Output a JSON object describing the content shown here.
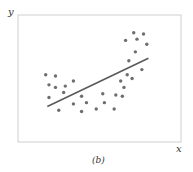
{
  "chart_data": {
    "type": "scatter",
    "title": "",
    "caption": "(b)",
    "xlabel": "x",
    "ylabel": "y",
    "grid": false,
    "legend": null,
    "xlim": [
      0,
      100
    ],
    "ylim": [
      0,
      100
    ],
    "points": [
      {
        "x": 17,
        "y": 53
      },
      {
        "x": 23,
        "y": 52
      },
      {
        "x": 19,
        "y": 45
      },
      {
        "x": 23,
        "y": 43
      },
      {
        "x": 29,
        "y": 44
      },
      {
        "x": 34,
        "y": 48
      },
      {
        "x": 28,
        "y": 39
      },
      {
        "x": 19,
        "y": 35
      },
      {
        "x": 25,
        "y": 25
      },
      {
        "x": 34,
        "y": 30
      },
      {
        "x": 39,
        "y": 36
      },
      {
        "x": 42,
        "y": 31
      },
      {
        "x": 39,
        "y": 24
      },
      {
        "x": 48,
        "y": 26
      },
      {
        "x": 52,
        "y": 38
      },
      {
        "x": 53,
        "y": 31
      },
      {
        "x": 59,
        "y": 26
      },
      {
        "x": 60,
        "y": 37
      },
      {
        "x": 63,
        "y": 48
      },
      {
        "x": 64,
        "y": 36
      },
      {
        "x": 65,
        "y": 43
      },
      {
        "x": 67,
        "y": 53
      },
      {
        "x": 68,
        "y": 64
      },
      {
        "x": 70,
        "y": 50
      },
      {
        "x": 66,
        "y": 80
      },
      {
        "x": 71,
        "y": 86
      },
      {
        "x": 73,
        "y": 81
      },
      {
        "x": 72,
        "y": 71
      },
      {
        "x": 77,
        "y": 85
      },
      {
        "x": 79,
        "y": 77
      },
      {
        "x": 76,
        "y": 57
      }
    ],
    "fit_line": {
      "x1": 18,
      "y1": 28,
      "x2": 80,
      "y2": 66
    },
    "annotations": [
      "linear fit through curved data"
    ]
  },
  "labels": {
    "x_axis": "x",
    "y_axis": "y",
    "caption": "(b)"
  },
  "colors": {
    "frame": "#cccccc",
    "dots": "#6e6e6e",
    "line": "#5a5a5a"
  }
}
